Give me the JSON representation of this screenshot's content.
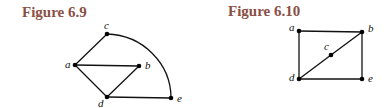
{
  "figures": [
    {
      "title": "Figure 6.9",
      "vertices": [
        {
          "id": "a",
          "label": "a"
        },
        {
          "id": "b",
          "label": "b"
        },
        {
          "id": "c",
          "label": "c"
        },
        {
          "id": "d",
          "label": "d"
        },
        {
          "id": "e",
          "label": "e"
        }
      ],
      "edges": [
        {
          "from": "a",
          "to": "c",
          "shape": "straight"
        },
        {
          "from": "a",
          "to": "b",
          "shape": "straight"
        },
        {
          "from": "a",
          "to": "d",
          "shape": "straight"
        },
        {
          "from": "b",
          "to": "d",
          "shape": "straight"
        },
        {
          "from": "d",
          "to": "e",
          "shape": "straight"
        },
        {
          "from": "c",
          "to": "e",
          "shape": "arc"
        }
      ]
    },
    {
      "title": "Figure 6.10",
      "vertices": [
        {
          "id": "a",
          "label": "a"
        },
        {
          "id": "b",
          "label": "b"
        },
        {
          "id": "c",
          "label": "c"
        },
        {
          "id": "d",
          "label": "d"
        },
        {
          "id": "e",
          "label": "e"
        }
      ],
      "edges": [
        {
          "from": "a",
          "to": "b",
          "shape": "straight"
        },
        {
          "from": "a",
          "to": "d",
          "shape": "straight"
        },
        {
          "from": "b",
          "to": "e",
          "shape": "straight"
        },
        {
          "from": "d",
          "to": "e",
          "shape": "straight"
        },
        {
          "from": "d",
          "to": "c",
          "shape": "straight"
        },
        {
          "from": "c",
          "to": "b",
          "shape": "straight"
        }
      ]
    }
  ]
}
